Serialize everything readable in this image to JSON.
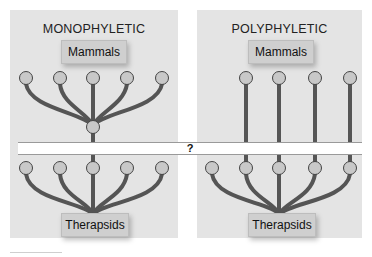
{
  "panels": {
    "left": {
      "title": "MONOPHYLETIC",
      "top_label": "Mammals",
      "bottom_label": "Therapsids"
    },
    "right": {
      "title": "POLYPHYLETIC",
      "top_label": "Mammals",
      "bottom_label": "Therapsids"
    }
  },
  "band": {
    "label": "?"
  },
  "colors": {
    "panel_bg": "#e4e4e4",
    "branch": "#555555",
    "node_fill": "#c8c8c8",
    "node_stroke": "#444444",
    "label_bg": "#cfcfcf"
  },
  "nodes": {
    "left_top": [
      26,
      60,
      93,
      127,
      162
    ],
    "left_mid": 93,
    "left_bottom": [
      26,
      60,
      93,
      127,
      162
    ],
    "right_top": [
      246,
      279,
      315,
      350
    ],
    "right_bottom": [
      212,
      246,
      279,
      315,
      350
    ]
  }
}
